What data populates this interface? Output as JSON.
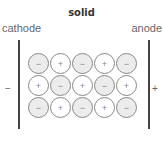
{
  "title": "solid",
  "labels": {
    "left": "cathode",
    "right": "anode"
  },
  "terminals": {
    "left_sign": "−",
    "right_sign": "+"
  },
  "grid": [
    [
      "−",
      "+",
      "−",
      "+",
      "−"
    ],
    [
      "+",
      "−",
      "+",
      "−",
      "+"
    ],
    [
      "−",
      "+",
      "−",
      "+",
      "−"
    ]
  ],
  "colors": {
    "negative_fill": "#ececec",
    "positive_fill": "#ffffff",
    "outline": "#888888"
  }
}
